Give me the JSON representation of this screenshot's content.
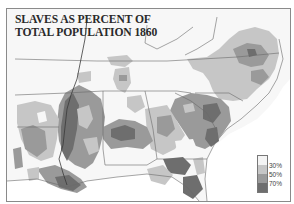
{
  "map": {
    "title_line1": "SLAVES AS PERCENT OF",
    "title_line2": "TOTAL POPULATION 1860",
    "legend": {
      "items": [
        {
          "label": "",
          "color": "#f4f4f4"
        },
        {
          "label": "30%",
          "color": "#c6c6c6"
        },
        {
          "label": "50%",
          "color": "#9a9a9a"
        },
        {
          "label": "70%",
          "color": "#6e6e6e"
        }
      ]
    },
    "colors": {
      "background": "#f7f7f7",
      "ocean": "#ffffff",
      "border": "#8a8a8a",
      "state_line": "#6a6a6a",
      "light": "#c6c6c6",
      "medium": "#9a9a9a",
      "dark": "#6e6e6e"
    },
    "region": "Southern United States, 1860"
  }
}
